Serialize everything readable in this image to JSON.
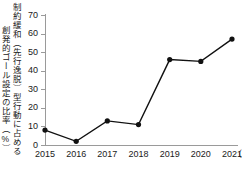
{
  "chart_data": {
    "type": "line",
    "title": "",
    "ylabel": "創発的ゴール設定の比率（%） 制約緩和（先行逸脱）型行動に占める",
    "ylabel_lines": [
      "創発的ゴール設定の比率（%）",
      "制約緩和（先行逸脱）型行動に占める"
    ],
    "xlabel": "",
    "x_unit": "（年度）",
    "categories": [
      "2015",
      "2016",
      "2017",
      "2018",
      "2019",
      "2020",
      "2021"
    ],
    "values": [
      8,
      2,
      13,
      11,
      46,
      45,
      57
    ],
    "series": [
      {
        "name": "創発的ゴール設定の比率",
        "values": [
          8,
          2,
          13,
          11,
          46,
          45,
          57
        ]
      }
    ],
    "ylim": [
      0,
      70
    ],
    "yticks": [
      0,
      10,
      20,
      30,
      40,
      50,
      60,
      70
    ],
    "ytick_labels": [
      "0",
      "10",
      "20",
      "30",
      "40",
      "50",
      "60",
      "70"
    ],
    "grid": false,
    "legend": "none",
    "line_color": "#111111",
    "marker": "circle",
    "marker_color": "#111111",
    "axis_color": "#9a9a9a",
    "background": "#ffffff"
  }
}
